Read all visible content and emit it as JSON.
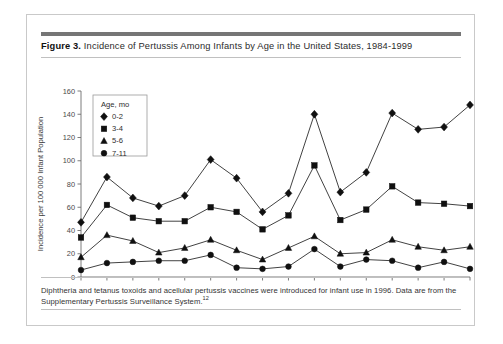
{
  "figure": {
    "label": "Figure 3.",
    "title": "Incidence of Pertussis Among Infants by Age in the United States, 1984-1999",
    "note_line1": "Diphtheria and tetanus toxoids and acellular pertussis vaccines were introduced for infant use in 1996. Data are from",
    "note_line2": "the Supplementary Pertussis Surveillance System.",
    "note_superscript": "12"
  },
  "chart_data": {
    "type": "line",
    "title": "Incidence of Pertussis Among Infants by Age in the United States, 1984-1999",
    "xlabel": "Year",
    "ylabel": "Incidence per 100 000 Infant Population",
    "categories": [
      "1984",
      "1985",
      "1986",
      "1987",
      "1988",
      "1989",
      "1990",
      "1991",
      "1992",
      "1993",
      "1994",
      "1995",
      "1996",
      "1997",
      "1998",
      "1999"
    ],
    "xlim": [
      1984,
      1999
    ],
    "ylim": [
      0,
      160
    ],
    "yticks": [
      0,
      20,
      40,
      60,
      80,
      100,
      120,
      140,
      160
    ],
    "grid": false,
    "legend_position": "top-left",
    "legend_title": "Age, mo",
    "series": [
      {
        "name": "0-2",
        "marker": "diamond",
        "color": "#101010",
        "values": [
          47,
          86,
          68,
          61,
          70,
          101,
          85,
          56,
          72,
          140,
          73,
          90,
          141,
          127,
          129,
          148
        ]
      },
      {
        "name": "3-4",
        "marker": "square",
        "color": "#101010",
        "values": [
          34,
          62,
          51,
          48,
          48,
          60,
          56,
          41,
          53,
          96,
          49,
          58,
          78,
          64,
          63,
          61
        ]
      },
      {
        "name": "5-6",
        "marker": "triangle",
        "color": "#101010",
        "values": [
          17,
          36,
          31,
          21,
          25,
          32,
          23,
          15,
          25,
          35,
          20,
          21,
          32,
          26,
          23,
          26
        ]
      },
      {
        "name": "7-11",
        "marker": "circle",
        "color": "#101010",
        "values": [
          6,
          12,
          13,
          14,
          14,
          19,
          8,
          7,
          9,
          24,
          9,
          15,
          14,
          8,
          13,
          7
        ]
      }
    ]
  }
}
